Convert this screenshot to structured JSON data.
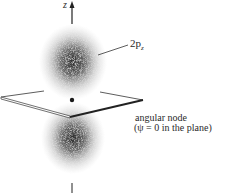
{
  "figure": {
    "axis_label": "z",
    "orbital_label": "2p",
    "orbital_subscript": "z",
    "node_label_line1": "angular node",
    "node_label_line2": "(ψ = 0 in the plane)"
  },
  "colors": {
    "cloud": "#2b2b2b",
    "ink": "#222222",
    "background": "#ffffff"
  }
}
